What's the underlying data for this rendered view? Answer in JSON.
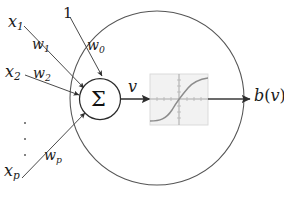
{
  "figure": {
    "background": "#ffffff",
    "stroke": "#3f3f3f",
    "text_color": "#1b1b1b"
  },
  "inputs": [
    {
      "name": "x1",
      "var": "x",
      "sub": "1",
      "weight_var": "w",
      "weight_sub": "1"
    },
    {
      "name": "x2",
      "var": "x",
      "sub": "2",
      "weight_var": "w",
      "weight_sub": "2"
    },
    {
      "name": "xp",
      "var": "x",
      "sub": "p",
      "weight_var": "w",
      "weight_sub": "p"
    }
  ],
  "bias": {
    "input_label": "1",
    "weight_var": "w",
    "weight_sub": "0"
  },
  "ellipsis": {
    "label": "vertical-dots",
    "count": 3
  },
  "summation": {
    "symbol": "Σ",
    "name": "summation-node"
  },
  "net_input": {
    "var": "v"
  },
  "activation": {
    "name": "activation-function-box",
    "curve": "sigmoid",
    "box_fill": "#f2f2f2",
    "axis_color": "#9a9a9a",
    "curve_color": "#8a8a8a"
  },
  "output": {
    "func": "b",
    "open_paren": "(",
    "arg": "v",
    "close_paren": ")"
  },
  "neuron_boundary": {
    "name": "neuron-boundary-circle",
    "cx": 157,
    "cy": 98,
    "r": 87
  },
  "labels": {
    "x1": "x",
    "x2": "x",
    "xp": "x",
    "w1": "w",
    "w2": "w",
    "wp": "w",
    "w0": "w",
    "one": "1",
    "v": "v",
    "sigma": "Σ",
    "out_b": "b",
    "out_v": "v"
  }
}
